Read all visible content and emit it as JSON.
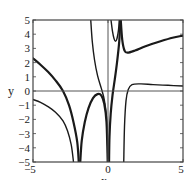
{
  "chart_data": {
    "type": "line",
    "title": "",
    "xlabel": "x",
    "ylabel": "y",
    "xlim": [
      -5,
      5
    ],
    "ylim": [
      -5,
      5
    ],
    "grid": false,
    "axes_lines_at_zero": true,
    "x_ticks": [
      -5,
      0,
      5
    ],
    "y_ticks": [
      -5,
      -4,
      -3,
      -2,
      -1,
      0,
      1,
      2,
      3,
      4,
      5
    ],
    "x_tick_labels": [
      "−5",
      "0",
      "5"
    ],
    "y_tick_labels": [
      "−5",
      "−4",
      "−3",
      "−2",
      "−1",
      "0",
      "1",
      "2",
      "3",
      "4",
      "5"
    ],
    "colors": {
      "curve": "#1a1a1a",
      "axis": "#555555",
      "frame": "#444444"
    },
    "series": [
      {
        "name": "branch-1-thick",
        "width": 2.2,
        "points": [
          [
            -5,
            2.3
          ],
          [
            -4.5,
            1.85
          ],
          [
            -4,
            1.35
          ],
          [
            -3.5,
            0.75
          ],
          [
            -3,
            0.0
          ],
          [
            -2.6,
            -1.0
          ],
          [
            -2.3,
            -2.2
          ],
          [
            -2.05,
            -3.6
          ],
          [
            -1.95,
            -5
          ]
        ]
      },
      {
        "name": "branch-2-thin",
        "width": 1.4,
        "points": [
          [
            -5,
            -0.6
          ],
          [
            -4.5,
            -0.8
          ],
          [
            -4,
            -1.1
          ],
          [
            -3.5,
            -1.5
          ],
          [
            -3,
            -2.1
          ],
          [
            -2.7,
            -2.8
          ],
          [
            -2.45,
            -3.8
          ],
          [
            -2.3,
            -5
          ]
        ]
      },
      {
        "name": "arch-thick",
        "width": 2.2,
        "points": [
          [
            -1.85,
            -5
          ],
          [
            -1.75,
            -3.5
          ],
          [
            -1.55,
            -2.2
          ],
          [
            -1.3,
            -1.2
          ],
          [
            -1.0,
            -0.5
          ],
          [
            -0.7,
            -0.22
          ],
          [
            -0.45,
            -0.3
          ],
          [
            -0.25,
            -0.9
          ],
          [
            -0.1,
            -2.2
          ],
          [
            -0.02,
            -5
          ]
        ]
      },
      {
        "name": "descending-thin",
        "width": 1.4,
        "points": [
          [
            -1.15,
            5
          ],
          [
            -1.05,
            3.5
          ],
          [
            -0.9,
            2.2
          ],
          [
            -0.7,
            1.1
          ],
          [
            -0.45,
            0.2
          ],
          [
            -0.25,
            -0.6
          ],
          [
            -0.1,
            -1.8
          ],
          [
            -0.03,
            -3.5
          ],
          [
            0.0,
            -5
          ]
        ]
      },
      {
        "name": "u-thin",
        "width": 1.4,
        "points": [
          [
            0.2,
            5
          ],
          [
            0.3,
            4.2
          ],
          [
            0.4,
            3.7
          ],
          [
            0.5,
            3.5
          ],
          [
            0.6,
            3.7
          ],
          [
            0.7,
            4.3
          ],
          [
            0.75,
            5
          ]
        ]
      },
      {
        "name": "right-upper-thick",
        "width": 2.2,
        "points": [
          [
            0.85,
            5
          ],
          [
            0.95,
            3.6
          ],
          [
            1.1,
            2.85
          ],
          [
            1.3,
            2.7
          ],
          [
            1.8,
            2.85
          ],
          [
            2.5,
            3.15
          ],
          [
            3.5,
            3.5
          ],
          [
            4.3,
            3.75
          ],
          [
            5,
            3.9
          ]
        ]
      },
      {
        "name": "center-descending-thick",
        "width": 2.2,
        "points": [
          [
            0.82,
            5
          ],
          [
            0.75,
            3.5
          ],
          [
            0.6,
            2.0
          ],
          [
            0.45,
            0.8
          ],
          [
            0.3,
            -0.3
          ],
          [
            0.18,
            -1.6
          ],
          [
            0.1,
            -3.2
          ],
          [
            0.07,
            -5
          ]
        ]
      },
      {
        "name": "right-lower-thin",
        "width": 1.4,
        "points": [
          [
            1.05,
            -5
          ],
          [
            1.1,
            -2.5
          ],
          [
            1.2,
            -0.7
          ],
          [
            1.35,
            0.1
          ],
          [
            1.6,
            0.45
          ],
          [
            2.2,
            0.5
          ],
          [
            3,
            0.45
          ],
          [
            4,
            0.4
          ],
          [
            5,
            0.35
          ]
        ]
      }
    ]
  }
}
